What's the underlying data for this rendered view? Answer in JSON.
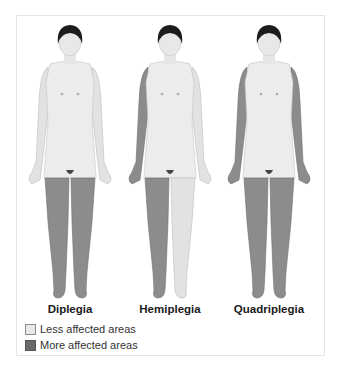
{
  "colors": {
    "skin_light": "#ececec",
    "skin_shade": "#c9c9c9",
    "affected": "#8c8c8c",
    "affected_shade": "#6e6e6e",
    "hair": "#1c1c1c",
    "less_swatch": "#e8e8e8",
    "more_swatch": "#6a6a6a"
  },
  "figures": [
    {
      "label": "Diplegia",
      "affected": [
        "left_leg",
        "right_leg"
      ]
    },
    {
      "label": "Hemiplegia",
      "affected": [
        "right_arm",
        "right_leg"
      ]
    },
    {
      "label": "Quadriplegia",
      "affected": [
        "left_arm",
        "right_arm",
        "left_leg",
        "right_leg"
      ]
    }
  ],
  "legend": {
    "items": [
      {
        "label": "Less affected areas",
        "swatch": "light"
      },
      {
        "label": "More affected areas",
        "swatch": "dark"
      }
    ]
  }
}
